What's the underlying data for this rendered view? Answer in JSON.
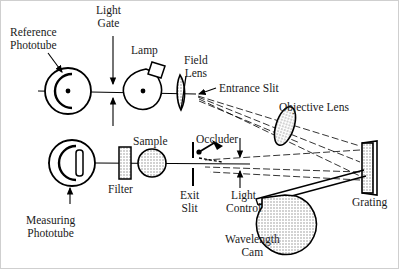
{
  "figure": {
    "background": "#ffffff",
    "line_color": "#000000",
    "hatch_color": "#8a8a8a",
    "labels": {
      "reference_phototube": "Reference\nPhototube",
      "light_gate": "Light\nGate",
      "lamp": "Lamp",
      "field_lens": "Field\nLens",
      "entrance_slit": "Entrance Slit",
      "objective_lens": "Objective Lens",
      "grating": "Grating",
      "occluder": "Occluder",
      "sample": "Sample",
      "filter": "Filter",
      "exit_slit": "Exit\nSlit",
      "light_control": "Light\nControl",
      "wavelength_cam": "Wavelength\nCam",
      "measuring_phototube": "Measuring\nPhototube"
    },
    "components": [
      {
        "name": "reference-phototube",
        "type": "phototube",
        "cx": 68,
        "cy": 91,
        "r": 23
      },
      {
        "name": "light-gate",
        "type": "slit-arrows",
        "x": 113,
        "cy": 91
      },
      {
        "name": "lamp",
        "type": "bulb",
        "cx": 146,
        "cy": 91
      },
      {
        "name": "field-lens",
        "type": "lens",
        "cx": 180,
        "cy": 92
      },
      {
        "name": "entrance-slit",
        "type": "point",
        "x": 196,
        "y": 95
      },
      {
        "name": "objective-lens",
        "type": "lens",
        "cx": 285,
        "cy": 125
      },
      {
        "name": "grating",
        "type": "grating",
        "x": 362,
        "y": 143
      },
      {
        "name": "wavelength-cam",
        "type": "cam",
        "cx": 285,
        "cy": 215
      },
      {
        "name": "occluder",
        "type": "lever",
        "x": 198,
        "y": 155
      },
      {
        "name": "exit-slit",
        "type": "slit",
        "x": 193,
        "cy": 163
      },
      {
        "name": "light-control",
        "type": "arrows",
        "x": 240,
        "cy": 163
      },
      {
        "name": "sample",
        "type": "disc",
        "cx": 152,
        "cy": 163
      },
      {
        "name": "filter",
        "type": "plate",
        "cx": 126,
        "cy": 163
      },
      {
        "name": "measuring-phototube",
        "type": "phototube",
        "cx": 72,
        "cy": 163,
        "r": 23
      }
    ]
  }
}
